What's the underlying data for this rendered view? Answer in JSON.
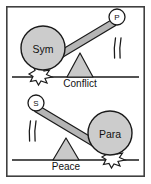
{
  "figure": {
    "panels": [
      {
        "id": "conflict",
        "ground_label": "Conflict",
        "heavy_side": "left",
        "weight": {
          "label": "Sym",
          "name": "symmetry-weight",
          "cx": 43,
          "cy": 48,
          "r": 22
        },
        "badge": {
          "label": "P",
          "name": "p-badge",
          "cx": 117,
          "cy": 17,
          "r": 8
        },
        "beam": {
          "x1": 34,
          "y1": 70,
          "x2": 113,
          "y2": 23
        },
        "fulcrum": {
          "apex_x": 80,
          "apex_y": 53,
          "base_left_x": 67,
          "base_right_x": 93,
          "base_y": 77
        },
        "ground_y": 77,
        "impact": {
          "name": "impact-burst-left",
          "cx": 40,
          "cy": 75
        },
        "motion_lines": {
          "name": "motion-lines-right",
          "cx": 118,
          "cy": 48
        }
      },
      {
        "id": "peace",
        "ground_label": "Peace",
        "heavy_side": "right",
        "weight": {
          "label": "Para",
          "name": "parallel-weight",
          "cx": 110,
          "cy": 133,
          "r": 22
        },
        "badge": {
          "label": "S",
          "name": "s-badge",
          "cx": 36,
          "cy": 103,
          "r": 8
        },
        "beam": {
          "x1": 40,
          "y1": 109,
          "x2": 119,
          "y2": 156
        },
        "fulcrum": {
          "apex_x": 66,
          "apex_y": 138,
          "base_left_x": 53,
          "base_right_x": 79,
          "base_y": 160
        },
        "ground_y": 160,
        "impact": {
          "name": "impact-burst-right",
          "cx": 113,
          "cy": 158
        },
        "motion_lines": {
          "name": "motion-lines-left",
          "cx": 33,
          "cy": 131
        }
      }
    ],
    "frame": {
      "x": 6,
      "y": 6,
      "width": 139,
      "height": 171
    },
    "colors": {
      "outline": "#1a1a1a",
      "frame_stroke": "#404040",
      "weight_fill": "#cccccc",
      "beam_fill": "#b5b5b5",
      "fulcrum_fill": "#c9c9c9",
      "badge_fill": "#ffffff",
      "burst_fill": "#ffffff",
      "background": "#ffffff"
    }
  }
}
